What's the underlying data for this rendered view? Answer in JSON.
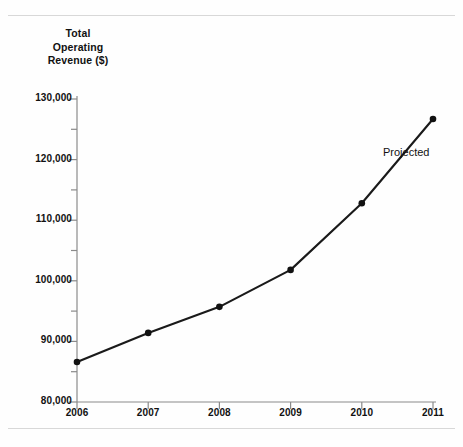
{
  "page": {
    "background_color": "#fefefe",
    "rule_color": "#d8d8d8"
  },
  "annotations": {
    "projected_label": "Projected"
  },
  "chart_data": {
    "type": "line",
    "title": "",
    "subtitle": "",
    "xlabel": "",
    "ylabel": "Total Operating Revenue ($)",
    "ylabel_lines": [
      "Total",
      "Operating",
      "Revenue ($)"
    ],
    "categories": [
      "2006",
      "2007",
      "2008",
      "2009",
      "2010",
      "2011"
    ],
    "x": [
      2006,
      2007,
      2008,
      2009,
      2010,
      2011
    ],
    "values": [
      86600,
      91400,
      95700,
      101800,
      112800,
      126700
    ],
    "series": [
      {
        "name": "Total Operating Revenue",
        "values": [
          86600,
          91400,
          95700,
          101800,
          112800,
          126700
        ]
      }
    ],
    "ylim": [
      80000,
      130000
    ],
    "xlim": [
      2006,
      2011
    ],
    "ytick_values": [
      80000,
      90000,
      100000,
      110000,
      120000,
      130000
    ],
    "ytick_labels": [
      "80,000",
      "90,000",
      "100,000",
      "110,000",
      "120,000",
      "130,000"
    ],
    "yminor_tick_values": [
      85000,
      95000,
      105000,
      115000,
      125000
    ],
    "xtick_labels": [
      "2006",
      "2007",
      "2008",
      "2009",
      "2010",
      "2011"
    ],
    "grid": false,
    "legend": false,
    "legend_position": "none",
    "line_color": "#1a1a1a",
    "marker": "circle",
    "marker_color": "#111111",
    "axis_color": "#808080",
    "annotations": [
      {
        "text": "Projected",
        "x": 2011,
        "y": 121000
      }
    ]
  }
}
